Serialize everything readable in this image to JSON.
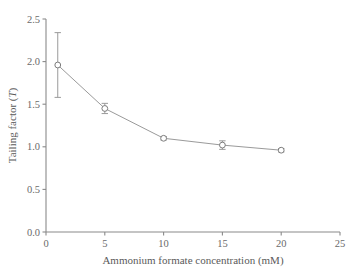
{
  "chart_data": {
    "type": "line",
    "title": "",
    "subtitle": "",
    "xlabel": "Ammonium formate concentration (mM)",
    "ylabel_main": "Tailing factor (",
    "ylabel_italic": "T",
    "ylabel_close": ")",
    "ylabel": "Tailing factor (T)",
    "x": [
      1,
      5,
      10,
      15,
      20
    ],
    "values": [
      1.96,
      1.45,
      1.1,
      1.02,
      0.96
    ],
    "errors": [
      0.38,
      0.06,
      0.02,
      0.05,
      0.02
    ],
    "xlim": [
      0,
      25
    ],
    "ylim": [
      0.0,
      2.5
    ],
    "xticks": [
      0,
      5,
      10,
      15,
      20,
      25
    ],
    "xtick_labels": [
      "0",
      "5",
      "10",
      "15",
      "20",
      "25"
    ],
    "yticks": [
      0.0,
      0.5,
      1.0,
      1.5,
      2.0,
      2.5
    ],
    "ytick_labels": [
      "0.0",
      "0.5",
      "1.0",
      "1.5",
      "2.0",
      "2.5"
    ],
    "grid": false,
    "legend": null,
    "marker": "open-circle",
    "series": [
      {
        "name": "Tailing factor",
        "x": [
          1,
          5,
          10,
          15,
          20
        ],
        "values": [
          1.96,
          1.45,
          1.1,
          1.02,
          0.96
        ],
        "errors": [
          0.38,
          0.06,
          0.02,
          0.05,
          0.02
        ]
      }
    ],
    "colors": {
      "line": "#9a9a9a",
      "marker_edge": "#7c7c7c",
      "marker_fill": "#ffffff",
      "axis": "#8a8a8a",
      "text": "#5a5a5a",
      "background": "#ffffff"
    }
  }
}
